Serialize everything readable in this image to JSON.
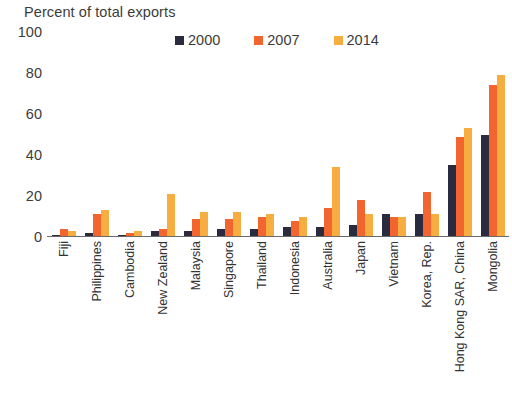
{
  "chart_data": {
    "type": "bar",
    "title": "Percent of total exports",
    "xlabel": "",
    "ylabel": "Percent of total exports",
    "ylim": [
      0,
      100
    ],
    "yticks": [
      0,
      20,
      40,
      60,
      80,
      100
    ],
    "grid": false,
    "legend_position": "top-center",
    "categories": [
      "Fiji",
      "Philippines",
      "Cambodia",
      "New Zealand",
      "Malaysia",
      "Singapore",
      "Thailand",
      "Indonesia",
      "Australia",
      "Japan",
      "Vietnam",
      "Korea, Rep.",
      "Hong Kong SAR, China",
      "Mongolia"
    ],
    "series": [
      {
        "name": "2000",
        "color": "#2b2b40",
        "values": [
          1,
          2,
          1,
          3,
          3,
          4,
          4,
          5,
          5,
          6,
          11,
          11,
          35,
          50
        ]
      },
      {
        "name": "2007",
        "color": "#f2652f",
        "values": [
          4,
          11,
          2,
          4,
          9,
          9,
          10,
          8,
          14,
          18,
          10,
          22,
          49,
          74
        ]
      },
      {
        "name": "2014",
        "color": "#f7ad3f",
        "values": [
          3,
          13,
          3,
          21,
          12,
          12,
          11,
          10,
          34,
          11,
          10,
          11,
          53,
          79
        ]
      }
    ]
  },
  "colors": {
    "series_2000": "#2b2b40",
    "series_2007": "#f2652f",
    "series_2014": "#f7ad3f",
    "axis": "#6b6b6b",
    "text": "#3c3c3c",
    "background": "#ffffff"
  }
}
